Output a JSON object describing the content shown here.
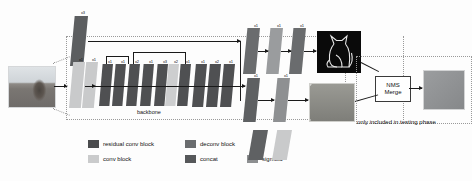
{
  "figure": {
    "backbone_label": "backbone",
    "repeat_label": "x3",
    "testing_note": "only included in testing phase",
    "nms_box": {
      "line1": "NMS",
      "line2": "Merge"
    }
  },
  "colors": {
    "residual_conv_block": "#4f5052",
    "conv_block": "#c9cacb",
    "deconv_block": "#686a6c",
    "concat": "#4f5052",
    "sigmoid": "#8e9092",
    "stroke": "#1a1a1a",
    "dashed": "#9a9a9a",
    "background": "#fdfdfd"
  },
  "legend": {
    "items": [
      {
        "label": "residual conv block",
        "color": "#4a4b4d"
      },
      {
        "label": "deconv block",
        "color": "#6a6c6e"
      },
      {
        "label": "conv block",
        "color": "#cacbcc"
      },
      {
        "label": "concat",
        "color": "#56585a"
      },
      {
        "label": "sigmoid",
        "color": "#8d8f91"
      }
    ]
  },
  "stem": {
    "top_slab_label": "x3",
    "slabs": [
      {
        "label": "x1"
      },
      {
        "label": "x1"
      },
      {
        "label": "x1"
      }
    ]
  },
  "backbone": {
    "label": "backbone",
    "slabs": [
      {
        "label": "x1"
      },
      {
        "label": "x1"
      },
      {
        "label": "x2"
      },
      {
        "label": "x1"
      },
      {
        "label": "x3"
      },
      {
        "label": "x2"
      },
      {
        "label": "x1"
      },
      {
        "label": "x1"
      },
      {
        "label": "x2"
      },
      {
        "label": "x1"
      },
      {
        "label": "x1"
      }
    ]
  },
  "branches": {
    "top": {
      "name": "contour-branch",
      "slabs": [
        {
          "label": "x1"
        },
        {
          "label": "x1"
        },
        {
          "label": "x1"
        }
      ],
      "output_image": "cat-contour-map"
    },
    "bottom": {
      "name": "texture-branch",
      "slabs": [
        {
          "label": "x1"
        },
        {
          "label": "x1"
        }
      ],
      "output_image": "texture-skeleton-map"
    }
  },
  "input": {
    "image_name": "cat-on-windowsill-photo"
  },
  "output": {
    "image_name": "merged-gray-output"
  }
}
